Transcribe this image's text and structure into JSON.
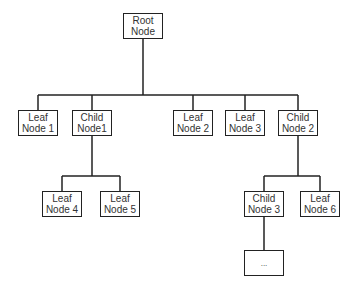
{
  "diagram": {
    "type": "tree",
    "nodes": [
      {
        "id": "root",
        "line1": "Root",
        "line2": "Node",
        "x": 123,
        "y": 13
      },
      {
        "id": "leaf1",
        "line1": "Leaf",
        "line2": "Node 1",
        "x": 18,
        "y": 110
      },
      {
        "id": "child1",
        "line1": "Child",
        "line2": "Node1",
        "x": 72,
        "y": 110
      },
      {
        "id": "leaf2",
        "line1": "Leaf",
        "line2": "Node 2",
        "x": 173,
        "y": 110
      },
      {
        "id": "leaf3",
        "line1": "Leaf",
        "line2": "Node 3",
        "x": 225,
        "y": 110
      },
      {
        "id": "child2",
        "line1": "Child",
        "line2": "Node 2",
        "x": 278,
        "y": 110
      },
      {
        "id": "leaf4",
        "line1": "Leaf",
        "line2": "Node 4",
        "x": 42,
        "y": 191
      },
      {
        "id": "leaf5",
        "line1": "Leaf",
        "line2": "Node 5",
        "x": 100,
        "y": 191
      },
      {
        "id": "child3",
        "line1": "Child",
        "line2": "Node 3",
        "x": 244,
        "y": 191
      },
      {
        "id": "leaf6",
        "line1": "Leaf",
        "line2": "Node 6",
        "x": 300,
        "y": 191
      },
      {
        "id": "more",
        "line1": "...",
        "line2": "",
        "x": 244,
        "y": 250
      }
    ],
    "edges": [
      [
        "root",
        "leaf1"
      ],
      [
        "root",
        "child1"
      ],
      [
        "root",
        "leaf2"
      ],
      [
        "root",
        "leaf3"
      ],
      [
        "root",
        "child2"
      ],
      [
        "child1",
        "leaf4"
      ],
      [
        "child1",
        "leaf5"
      ],
      [
        "child2",
        "child3"
      ],
      [
        "child2",
        "leaf6"
      ],
      [
        "child3",
        "more"
      ]
    ]
  }
}
